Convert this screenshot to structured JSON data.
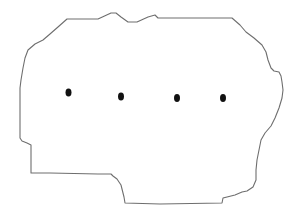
{
  "figure": {
    "outline_color": "#6e6e6e",
    "dot_color": "#111111",
    "background_color": "#ffffff",
    "dot_count": 4,
    "dots": [
      {
        "id": "dot-1"
      },
      {
        "id": "dot-2"
      },
      {
        "id": "dot-3"
      },
      {
        "id": "dot-4"
      }
    ]
  }
}
